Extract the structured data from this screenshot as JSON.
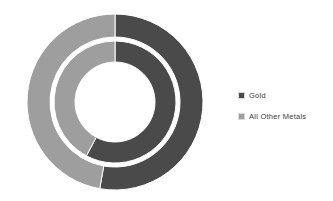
{
  "chart_data": {
    "type": "pie",
    "variant": "doughnut",
    "title": "",
    "subtitle": "",
    "xlabel": "",
    "ylabel": "",
    "grid": false,
    "legend_position": "right",
    "categories": [
      "Gold",
      "All Other Metals"
    ],
    "colors": {
      "gold": "#4a4a4a",
      "all_other_metals": "#9e9e9e",
      "background": "#ffffff"
    },
    "series": [
      {
        "name": "Inner Ring",
        "ring": "inner",
        "values": [
          58,
          42
        ],
        "start_angle_deg": 0,
        "sweeps_deg": [
          208,
          152
        ]
      },
      {
        "name": "Outer Ring",
        "ring": "outer",
        "values": [
          53,
          47
        ],
        "start_angle_deg": 0,
        "sweeps_deg": [
          190,
          170
        ]
      }
    ],
    "geometry": {
      "center_x": 101,
      "center_y": 94,
      "outer_ring_outer_radius": 88,
      "outer_ring_inner_radius": 65,
      "inner_ring_outer_radius": 61,
      "inner_ring_inner_radius": 40
    }
  },
  "legend": {
    "items": [
      {
        "label": "Gold",
        "color": "#4a4a4a",
        "swatch_name": "legend-swatch-gold"
      },
      {
        "label": "All Other Metals",
        "color": "#9e9e9e",
        "swatch_name": "legend-swatch-all-other-metals"
      }
    ]
  }
}
